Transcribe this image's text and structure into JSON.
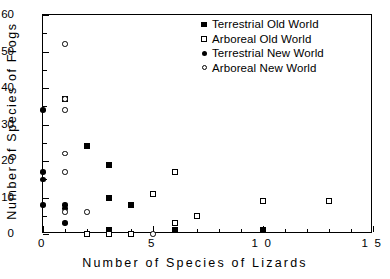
{
  "chart_data": {
    "type": "scatter",
    "title": "",
    "xlabel": "Number of Species of Lizards",
    "ylabel": "Number of Species of Frogs",
    "xlim": [
      0,
      15
    ],
    "ylim": [
      0,
      60
    ],
    "xticks": [
      0,
      5,
      10,
      15
    ],
    "xticklabels": [
      "0",
      "5",
      "1 0",
      "1 5"
    ],
    "xminorticks": [
      1,
      2,
      3,
      4,
      6,
      7,
      8,
      9,
      11,
      12,
      13,
      14
    ],
    "yticks": [
      0,
      10,
      20,
      30,
      40,
      50,
      60
    ],
    "yticklabels": [
      "0",
      "10",
      "20",
      "30",
      "40",
      "50",
      "60"
    ],
    "yminorticks": [
      5,
      15,
      25,
      35,
      45,
      55
    ],
    "grid": false,
    "legend_position": "top-right",
    "series": [
      {
        "name": "Terrestrial Old World",
        "marker": "sq-filled",
        "points": [
          [
            1,
            37
          ],
          [
            2,
            24
          ],
          [
            3,
            19
          ],
          [
            3,
            10
          ],
          [
            3,
            1
          ],
          [
            4,
            8
          ],
          [
            6,
            1
          ],
          [
            10,
            1
          ]
        ]
      },
      {
        "name": "Arboreal Old World",
        "marker": "sq-open",
        "points": [
          [
            2,
            0
          ],
          [
            3,
            0
          ],
          [
            4,
            0
          ],
          [
            5,
            11
          ],
          [
            6,
            17
          ],
          [
            6,
            3
          ],
          [
            7,
            5
          ],
          [
            10,
            9
          ],
          [
            13,
            9
          ]
        ]
      },
      {
        "name": "Terrestrial New World",
        "marker": "ci-filled",
        "points": [
          [
            0,
            34
          ],
          [
            0,
            17
          ],
          [
            0,
            15
          ],
          [
            0,
            8
          ],
          [
            1,
            8
          ],
          [
            1,
            7
          ],
          [
            1,
            3
          ]
        ]
      },
      {
        "name": "Arboreal New World",
        "marker": "ci-open",
        "points": [
          [
            1,
            52
          ],
          [
            1,
            37
          ],
          [
            1,
            34
          ],
          [
            1,
            22
          ],
          [
            1,
            17
          ],
          [
            1,
            6
          ],
          [
            2,
            6
          ],
          [
            5,
            0
          ]
        ]
      }
    ]
  }
}
